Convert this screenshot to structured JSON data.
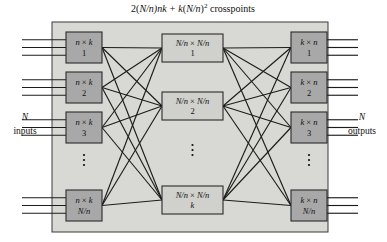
{
  "title_parts": {
    "prefix": "2(",
    "frac1": "N/n",
    "mid": ")nk + ",
    "k": "k",
    "open": "(",
    "frac2": "N/n",
    "close": ")",
    "exp": "2",
    "suffix": " crosspoints"
  },
  "labels": {
    "inputs_symbol": "N",
    "inputs_word": "inputs",
    "outputs_symbol": "N",
    "outputs_word": "outputs",
    "vertical_ellipsis": "⋮"
  },
  "colors": {
    "panel_fill": "#d8d8d4",
    "panel_stroke": "#3a3a3a",
    "outer_box_fill": "#a8a8a8",
    "middle_box_fill": "#d0d0cc",
    "box_stroke": "#2b2b2b",
    "line": "#1c1c1c",
    "text": "#101010",
    "page_background": "#ffffff"
  },
  "diagram": {
    "type": "clos-network-three-stage",
    "panel": {
      "x": 52,
      "y": 22,
      "width": 276,
      "height": 210
    },
    "input_stage": {
      "dimension_label": "n × k",
      "box_width": 36,
      "box_height": 31,
      "x": 66,
      "boxes": [
        {
          "index": "1",
          "y": 32
        },
        {
          "index": "2",
          "y": 72
        },
        {
          "index": "3",
          "y": 112
        },
        {
          "index": "N/n",
          "y": 190
        }
      ],
      "ellipsis_y": 160,
      "lines_per_box": 3,
      "io_line_start_x": 22
    },
    "middle_stage": {
      "dimension_label": "N/n × N/n",
      "box_width": 61,
      "box_height": 28,
      "x": 162,
      "boxes": [
        {
          "index": "1",
          "y": 34
        },
        {
          "index": "2",
          "y": 92
        },
        {
          "index": "k",
          "y": 186
        }
      ],
      "ellipsis_y": 150
    },
    "output_stage": {
      "dimension_label": "k × n",
      "box_width": 36,
      "box_height": 31,
      "x": 291,
      "boxes": [
        {
          "index": "1",
          "y": 32
        },
        {
          "index": "2",
          "y": 72
        },
        {
          "index": "3",
          "y": 112
        },
        {
          "index": "N/n",
          "y": 190
        }
      ],
      "ellipsis_y": 160,
      "lines_per_box": 3,
      "io_line_end_x": 358
    },
    "side_labels": {
      "input_label_x": 25,
      "input_label_y": 125,
      "output_label_x": 362,
      "output_label_y": 125
    },
    "title_position": {
      "x": 193,
      "y": 10
    }
  }
}
